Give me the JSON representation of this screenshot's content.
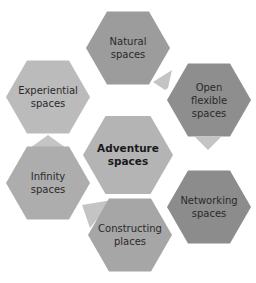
{
  "diagram": {
    "center": {
      "label_lines": [
        "Adventure",
        "spaces"
      ],
      "color": "#b4b4b4"
    },
    "nodes": [
      {
        "id": "natural",
        "label_lines": [
          "Natural",
          "spaces"
        ],
        "color": "#9c9c9c"
      },
      {
        "id": "open-flexible",
        "label_lines": [
          "Open",
          "flexible",
          "spaces"
        ],
        "color": "#8e8e8e"
      },
      {
        "id": "networking",
        "label_lines": [
          "Networking",
          "spaces"
        ],
        "color": "#8c8c8c"
      },
      {
        "id": "constructing",
        "label_lines": [
          "Constructing",
          "places"
        ],
        "color": "#a6a6a6"
      },
      {
        "id": "infinity",
        "label_lines": [
          "Infinity",
          "spaces"
        ],
        "color": "#adadad"
      },
      {
        "id": "experiential",
        "label_lines": [
          "Experiential",
          "spaces"
        ],
        "color": "#bbbbbb"
      }
    ],
    "connector_color": "#c4c4c4"
  }
}
